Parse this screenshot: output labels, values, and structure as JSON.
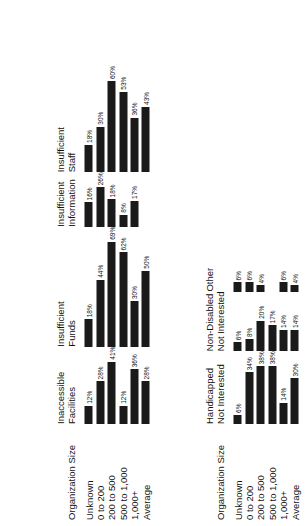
{
  "chart_data": {
    "type": "bar",
    "orientation": "horizontal",
    "rotation": "page content rotated 90 degrees counter-clockwise",
    "grid": false,
    "legend": "none",
    "xlabel": "",
    "ylabel": "",
    "value_suffix": "%",
    "stub_title": "Organization Size",
    "categories": [
      "Unknown",
      "0 to 200",
      "200 to 500",
      "500 to 1,000",
      "1,000+",
      "Average"
    ],
    "panels": [
      {
        "title": "Inaccessible Facilities",
        "values": [
          12,
          28,
          41,
          12,
          36,
          28
        ],
        "labels": [
          "12%",
          "28%",
          "41%",
          "12%",
          "36%",
          "28%"
        ]
      },
      {
        "title": "Insufficient Funds",
        "values": [
          18,
          44,
          69,
          62,
          30,
          50
        ],
        "labels": [
          "18%",
          "44%",
          "69%",
          "62%",
          "30%",
          "50%"
        ]
      },
      {
        "title": "Insufficient Information",
        "values": [
          16,
          26,
          18,
          8,
          17,
          null
        ],
        "labels": [
          "16%",
          "26%",
          "18%",
          "8%",
          "17%",
          ""
        ]
      },
      {
        "title": "Insufficient Staff",
        "values": [
          18,
          30,
          60,
          53,
          36,
          43
        ],
        "labels": [
          "18%",
          "30%",
          "60%",
          "53%",
          "36%",
          "43%"
        ]
      },
      {
        "title": "Handicapped Not Interested",
        "values": [
          6,
          34,
          38,
          38,
          14,
          30
        ],
        "labels": [
          "6%",
          "34%",
          "38%",
          "38%",
          "14%",
          "30%"
        ]
      },
      {
        "title": "Non-Disabled Not Interested",
        "values": [
          6,
          8,
          20,
          17,
          14,
          14
        ],
        "labels": [
          "6%",
          "8%",
          "20%",
          "17%",
          "14%",
          "14%"
        ]
      },
      {
        "title": "Other",
        "values": [
          6,
          6,
          4,
          null,
          6,
          4
        ],
        "labels": [
          "6%",
          "6%",
          "4%",
          "",
          "6%",
          "4%"
        ]
      }
    ],
    "bands": [
      {
        "stub_title": "Organization Size",
        "panel_indexes": [
          0,
          1,
          2,
          3
        ]
      },
      {
        "stub_title": "Organization Size",
        "panel_indexes": [
          4,
          5,
          6
        ]
      }
    ],
    "bar_color": "#1a1a1a",
    "background_color": "#ffffff",
    "value_max": 69
  }
}
